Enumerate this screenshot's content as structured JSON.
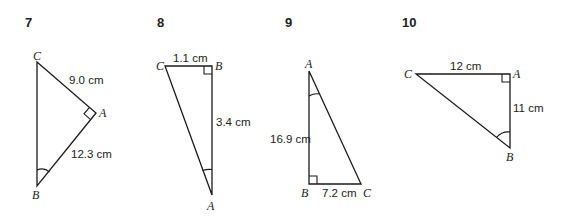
{
  "problems": [
    {
      "number": "7",
      "vertices": {
        "C": "C",
        "A": "A",
        "B": "B"
      },
      "right_angle_at": "A",
      "marked_angle_at": "B",
      "sides": [
        {
          "between": [
            "C",
            "A"
          ],
          "label": "9.0 cm"
        },
        {
          "between": [
            "A",
            "B"
          ],
          "label": "12.3 cm"
        }
      ]
    },
    {
      "number": "8",
      "vertices": {
        "C": "C",
        "B": "B",
        "A": "A"
      },
      "right_angle_at": "B",
      "marked_angle_at": "A",
      "sides": [
        {
          "between": [
            "C",
            "B"
          ],
          "label": "1.1 cm"
        },
        {
          "between": [
            "B",
            "A"
          ],
          "label": "3.4 cm"
        }
      ]
    },
    {
      "number": "9",
      "vertices": {
        "A": "A",
        "B": "B",
        "C": "C"
      },
      "right_angle_at": "B",
      "marked_angle_at": "A",
      "sides": [
        {
          "between": [
            "A",
            "B"
          ],
          "label": "16.9 cm"
        },
        {
          "between": [
            "B",
            "C"
          ],
          "label": "7.2 cm"
        }
      ]
    },
    {
      "number": "10",
      "vertices": {
        "C": "C",
        "A": "A",
        "B": "B"
      },
      "right_angle_at": "A",
      "marked_angle_at": "B",
      "sides": [
        {
          "between": [
            "C",
            "A"
          ],
          "label": "12 cm"
        },
        {
          "between": [
            "A",
            "B"
          ],
          "label": "11 cm"
        }
      ]
    }
  ]
}
